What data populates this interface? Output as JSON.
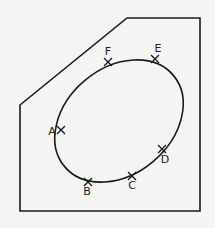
{
  "diagram": {
    "outline_points": [
      [
        20,
        105
      ],
      [
        127,
        18
      ],
      [
        200,
        18
      ],
      [
        200,
        211
      ],
      [
        20,
        211
      ]
    ],
    "ellipse": {
      "cx": 119,
      "cy": 121,
      "rx": 71,
      "ry": 53,
      "rotation": -40
    },
    "stroke_color": "#1a1a1a",
    "background": "#f4f4f2",
    "points": [
      {
        "label": "F",
        "x": 108,
        "y": 62,
        "lx": 108,
        "ly": 55
      },
      {
        "label": "E",
        "x": 155,
        "y": 59,
        "lx": 158,
        "ly": 52
      },
      {
        "label": "A",
        "x": 61,
        "y": 130,
        "lx": 52,
        "ly": 135
      },
      {
        "label": "D",
        "x": 162,
        "y": 149,
        "lx": 165,
        "ly": 163
      },
      {
        "label": "C",
        "x": 132,
        "y": 176,
        "lx": 132,
        "ly": 189
      },
      {
        "label": "B",
        "x": 88,
        "y": 182,
        "lx": 87,
        "ly": 195
      }
    ]
  }
}
